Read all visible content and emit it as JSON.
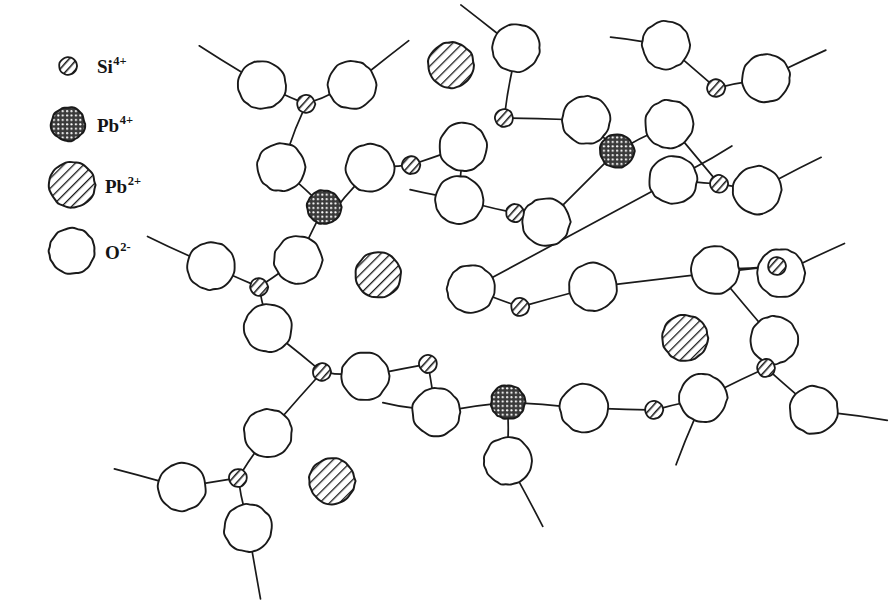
{
  "figure": {
    "background_color": "#ffffff",
    "ink_color": "#1a1a1a",
    "width": 892,
    "height": 614
  },
  "legend": {
    "items": [
      {
        "id": "si4plus",
        "species": "Si",
        "charge": "4+",
        "label": "Si",
        "superscript": "4+",
        "marker": "small-slashed-circle",
        "radius": 9,
        "fill_pattern": "diagonal-slash",
        "color": "#1a1a1a",
        "marker_x": 68,
        "marker_y": 66,
        "label_x": 97,
        "label_y": 73
      },
      {
        "id": "pb4plus",
        "species": "Pb",
        "charge": "4+",
        "label": "Pb",
        "superscript": "4+",
        "marker": "dark-crosshatch-circle",
        "radius": 17,
        "fill_pattern": "dense-crosshatch",
        "color": "#2b2b2b",
        "marker_x": 68,
        "marker_y": 124,
        "label_x": 97,
        "label_y": 132
      },
      {
        "id": "pb2plus",
        "species": "Pb",
        "charge": "2+",
        "label": "Pb",
        "superscript": "2+",
        "marker": "hatched-circle",
        "radius": 23,
        "fill_pattern": "diagonal-hatch",
        "color": "#1a1a1a",
        "marker_x": 72,
        "marker_y": 185,
        "label_x": 105,
        "label_y": 193
      },
      {
        "id": "o2minus",
        "species": "O",
        "charge": "2-",
        "label": "O",
        "superscript": "2-",
        "marker": "open-circle",
        "radius": 23,
        "fill_pattern": "none",
        "color": "#ffffff",
        "marker_x": 72,
        "marker_y": 251,
        "label_x": 105,
        "label_y": 259
      }
    ]
  },
  "network": {
    "description": "Random network of oxygen anions bridged by silicon and lead(IV) cations, with lead(II) cations sitting in network interstices as modifiers.",
    "oxygen_radius": 24,
    "silicon_radius": 9,
    "lead4_radius": 17,
    "lead2_radius": 23,
    "oxygen_atoms": [
      {
        "id": "o1",
        "x": 262,
        "y": 85
      },
      {
        "id": "o2",
        "x": 352,
        "y": 85
      },
      {
        "id": "o3",
        "x": 281,
        "y": 167
      },
      {
        "id": "o4",
        "x": 370,
        "y": 168
      },
      {
        "id": "o5",
        "x": 516,
        "y": 48
      },
      {
        "id": "o6",
        "x": 463,
        "y": 147
      },
      {
        "id": "o7",
        "x": 586,
        "y": 120
      },
      {
        "id": "o8",
        "x": 669,
        "y": 124
      },
      {
        "id": "o9",
        "x": 459,
        "y": 200
      },
      {
        "id": "o10",
        "x": 546,
        "y": 222
      },
      {
        "id": "o11",
        "x": 666,
        "y": 45
      },
      {
        "id": "o12",
        "x": 766,
        "y": 78
      },
      {
        "id": "o13",
        "x": 673,
        "y": 180
      },
      {
        "id": "o14",
        "x": 757,
        "y": 190
      },
      {
        "id": "o15",
        "x": 211,
        "y": 266
      },
      {
        "id": "o16",
        "x": 298,
        "y": 260
      },
      {
        "id": "o17",
        "x": 268,
        "y": 328
      },
      {
        "id": "o18",
        "x": 471,
        "y": 289
      },
      {
        "id": "o19",
        "x": 593,
        "y": 287
      },
      {
        "id": "o20",
        "x": 715,
        "y": 270
      },
      {
        "id": "o21",
        "x": 781,
        "y": 273
      },
      {
        "id": "o22",
        "x": 774,
        "y": 340
      },
      {
        "id": "o23",
        "x": 365,
        "y": 376
      },
      {
        "id": "o24",
        "x": 436,
        "y": 412
      },
      {
        "id": "o25",
        "x": 508,
        "y": 461
      },
      {
        "id": "o26",
        "x": 584,
        "y": 408
      },
      {
        "id": "o27",
        "x": 703,
        "y": 398
      },
      {
        "id": "o28",
        "x": 814,
        "y": 410
      },
      {
        "id": "o29",
        "x": 268,
        "y": 433
      },
      {
        "id": "o30",
        "x": 182,
        "y": 487
      },
      {
        "id": "o31",
        "x": 248,
        "y": 528
      }
    ],
    "silicon_atoms": [
      {
        "id": "si1",
        "x": 306,
        "y": 104
      },
      {
        "id": "si2",
        "x": 504,
        "y": 118
      },
      {
        "id": "si3",
        "x": 716,
        "y": 88
      },
      {
        "id": "si4",
        "x": 411,
        "y": 165
      },
      {
        "id": "si5",
        "x": 719,
        "y": 184
      },
      {
        "id": "si6",
        "x": 515,
        "y": 213
      },
      {
        "id": "si7",
        "x": 259,
        "y": 287
      },
      {
        "id": "si8",
        "x": 520,
        "y": 307
      },
      {
        "id": "si9",
        "x": 777,
        "y": 266
      },
      {
        "id": "si10",
        "x": 322,
        "y": 372
      },
      {
        "id": "si11",
        "x": 428,
        "y": 364
      },
      {
        "id": "si12",
        "x": 766,
        "y": 368
      },
      {
        "id": "si13",
        "x": 654,
        "y": 410
      },
      {
        "id": "si14",
        "x": 238,
        "y": 478
      }
    ],
    "lead4_atoms": [
      {
        "id": "pb4a",
        "x": 324,
        "y": 207
      },
      {
        "id": "pb4b",
        "x": 617,
        "y": 151
      },
      {
        "id": "pb4c",
        "x": 508,
        "y": 402
      }
    ],
    "lead2_atoms": [
      {
        "id": "pb2a",
        "x": 451,
        "y": 65
      },
      {
        "id": "pb2b",
        "x": 378,
        "y": 275
      },
      {
        "id": "pb2c",
        "x": 685,
        "y": 338
      },
      {
        "id": "pb2d",
        "x": 332,
        "y": 481
      }
    ],
    "bonds": [
      {
        "from": "o1",
        "to": "si1"
      },
      {
        "from": "o2",
        "to": "si1"
      },
      {
        "from": "si1",
        "to": "o3"
      },
      {
        "from": "o3",
        "to": "pb4a"
      },
      {
        "from": "pb4a",
        "to": "o16"
      },
      {
        "from": "o4",
        "to": "si4"
      },
      {
        "from": "si4",
        "to": "o6"
      },
      {
        "from": "o5",
        "to": "si2"
      },
      {
        "from": "si2",
        "to": "o7"
      },
      {
        "from": "o7",
        "to": "pb4b"
      },
      {
        "from": "pb4b",
        "to": "o8"
      },
      {
        "from": "pb4b",
        "to": "o10"
      },
      {
        "from": "o6",
        "to": "o9"
      },
      {
        "from": "o9",
        "to": "si6"
      },
      {
        "from": "si6",
        "to": "o10"
      },
      {
        "from": "o11",
        "to": "si3"
      },
      {
        "from": "si3",
        "to": "o12"
      },
      {
        "from": "o8",
        "to": "si5"
      },
      {
        "from": "si5",
        "to": "o13"
      },
      {
        "from": "si5",
        "to": "o14"
      },
      {
        "from": "o15",
        "to": "si7"
      },
      {
        "from": "o16",
        "to": "si7"
      },
      {
        "from": "si7",
        "to": "o17"
      },
      {
        "from": "o17",
        "to": "si10"
      },
      {
        "from": "si10",
        "to": "o23"
      },
      {
        "from": "o18",
        "to": "si8"
      },
      {
        "from": "si8",
        "to": "o19"
      },
      {
        "from": "o13",
        "to": "o18"
      },
      {
        "from": "o19",
        "to": "si9"
      },
      {
        "from": "si9",
        "to": "o20"
      },
      {
        "from": "si9",
        "to": "o21"
      },
      {
        "from": "o20",
        "to": "o22"
      },
      {
        "from": "o22",
        "to": "si12"
      },
      {
        "from": "si12",
        "to": "o27"
      },
      {
        "from": "si12",
        "to": "o28"
      },
      {
        "from": "o23",
        "to": "si11"
      },
      {
        "from": "si11",
        "to": "o24"
      },
      {
        "from": "o24",
        "to": "pb4c"
      },
      {
        "from": "pb4c",
        "to": "o25"
      },
      {
        "from": "pb4c",
        "to": "o26"
      },
      {
        "from": "o26",
        "to": "si13"
      },
      {
        "from": "si13",
        "to": "o27"
      },
      {
        "from": "o29",
        "to": "si14"
      },
      {
        "from": "si14",
        "to": "o30"
      },
      {
        "from": "si14",
        "to": "o31"
      },
      {
        "from": "si10",
        "to": "o29"
      }
    ],
    "dangling_bonds": [
      {
        "from": "o1",
        "angle": 212,
        "length": 52
      },
      {
        "from": "o2",
        "angle": 322,
        "length": 50
      },
      {
        "from": "o5",
        "angle": 218,
        "length": 48
      },
      {
        "from": "o11",
        "angle": 188,
        "length": 34
      },
      {
        "from": "o12",
        "angle": 335,
        "length": 44
      },
      {
        "from": "o14",
        "angle": 333,
        "length": 50
      },
      {
        "from": "o15",
        "angle": 205,
        "length": 48
      },
      {
        "from": "o13",
        "angle": 330,
        "length": 46
      },
      {
        "from": "o21",
        "angle": 335,
        "length": 48
      },
      {
        "from": "o28",
        "angle": 8,
        "length": 52
      },
      {
        "from": "o25",
        "angle": 62,
        "length": 52
      },
      {
        "from": "o27",
        "angle": 112,
        "length": 50
      },
      {
        "from": "o30",
        "angle": 195,
        "length": 48
      },
      {
        "from": "o31",
        "angle": 80,
        "length": 50
      },
      {
        "from": "o4",
        "angle": 130,
        "length": 34
      },
      {
        "from": "o9",
        "angle": 192,
        "length": 28
      },
      {
        "from": "o24",
        "angle": 190,
        "length": 32
      }
    ]
  }
}
